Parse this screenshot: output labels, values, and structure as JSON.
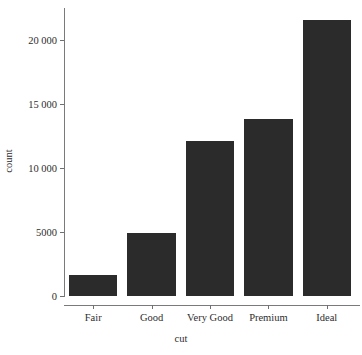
{
  "chart_data": {
    "type": "bar",
    "title": "",
    "xlabel": "cut",
    "ylabel": "count",
    "categories": [
      "Fair",
      "Good",
      "Very Good",
      "Premium",
      "Ideal"
    ],
    "values": [
      1610,
      4906,
      12082,
      13791,
      21551
    ],
    "ylim": [
      0,
      22500
    ],
    "yticks": [
      0,
      5000,
      10000,
      15000,
      20000
    ],
    "ytick_labels": [
      "0",
      "5000",
      "10 000",
      "15 000",
      "20 000"
    ],
    "grid": false,
    "legend": "none",
    "bar_color": "#2b2b2b",
    "axis_color": "#7a7a7a",
    "background": "#ffffff"
  },
  "axis": {
    "x_title": "cut",
    "y_title": "count"
  }
}
